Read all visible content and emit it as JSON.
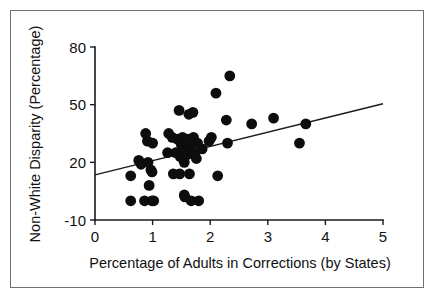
{
  "figure": {
    "background_color": "#ffffff",
    "border_color": "#6f6f6f",
    "marker_color": "#0d0d0d",
    "line_color": "#1a1a1a"
  },
  "chart_data": {
    "type": "scatter",
    "title": "",
    "xlabel": "Percentage of Adults in Corrections (by States)",
    "ylabel": "Non-White Disparity (Percentage)",
    "xlim": [
      0,
      5
    ],
    "ylim": [
      -10,
      80
    ],
    "xticks": [
      0,
      1,
      2,
      3,
      4,
      5
    ],
    "xtick_labels": [
      "0",
      "1",
      "2",
      "3",
      "4",
      "5"
    ],
    "yticks": [
      -10,
      20,
      50,
      80
    ],
    "ytick_labels": [
      "-10",
      "20",
      "50",
      "80"
    ],
    "grid": false,
    "legend": false,
    "points": [
      {
        "x": 0.62,
        "y": 13
      },
      {
        "x": 0.62,
        "y": 0
      },
      {
        "x": 0.76,
        "y": 21
      },
      {
        "x": 0.8,
        "y": 19
      },
      {
        "x": 0.86,
        "y": 0
      },
      {
        "x": 0.88,
        "y": 35
      },
      {
        "x": 0.91,
        "y": 31
      },
      {
        "x": 0.92,
        "y": 20
      },
      {
        "x": 0.94,
        "y": 8
      },
      {
        "x": 0.97,
        "y": 16
      },
      {
        "x": 0.99,
        "y": 15
      },
      {
        "x": 0.99,
        "y": 0
      },
      {
        "x": 1.0,
        "y": 30
      },
      {
        "x": 1.02,
        "y": 0
      },
      {
        "x": 1.26,
        "y": 25
      },
      {
        "x": 1.28,
        "y": 35
      },
      {
        "x": 1.34,
        "y": 33
      },
      {
        "x": 1.36,
        "y": 14
      },
      {
        "x": 1.4,
        "y": 25
      },
      {
        "x": 1.43,
        "y": 32
      },
      {
        "x": 1.46,
        "y": 47
      },
      {
        "x": 1.47,
        "y": 14
      },
      {
        "x": 1.48,
        "y": 23
      },
      {
        "x": 1.5,
        "y": 29
      },
      {
        "x": 1.52,
        "y": 33
      },
      {
        "x": 1.54,
        "y": 26
      },
      {
        "x": 1.55,
        "y": 20
      },
      {
        "x": 1.55,
        "y": 3
      },
      {
        "x": 1.56,
        "y": 2
      },
      {
        "x": 1.58,
        "y": 31
      },
      {
        "x": 1.6,
        "y": 24
      },
      {
        "x": 1.62,
        "y": 32
      },
      {
        "x": 1.63,
        "y": 45
      },
      {
        "x": 1.64,
        "y": 14
      },
      {
        "x": 1.66,
        "y": 28
      },
      {
        "x": 1.67,
        "y": 0
      },
      {
        "x": 1.68,
        "y": 26
      },
      {
        "x": 1.7,
        "y": 46
      },
      {
        "x": 1.71,
        "y": 33
      },
      {
        "x": 1.73,
        "y": 24
      },
      {
        "x": 1.76,
        "y": 22
      },
      {
        "x": 1.78,
        "y": 30
      },
      {
        "x": 1.8,
        "y": 0
      },
      {
        "x": 1.86,
        "y": 27
      },
      {
        "x": 1.98,
        "y": 31
      },
      {
        "x": 2.02,
        "y": 33
      },
      {
        "x": 2.1,
        "y": 56
      },
      {
        "x": 2.13,
        "y": 13
      },
      {
        "x": 2.28,
        "y": 42
      },
      {
        "x": 2.3,
        "y": 30
      },
      {
        "x": 2.34,
        "y": 65
      },
      {
        "x": 2.72,
        "y": 40
      },
      {
        "x": 3.1,
        "y": 43
      },
      {
        "x": 3.55,
        "y": 30
      },
      {
        "x": 3.66,
        "y": 40
      }
    ],
    "trend_line": {
      "x0": 0,
      "y0": 13.5,
      "x1": 5,
      "y1": 50.5
    },
    "marker_radius_px": 5.4
  }
}
